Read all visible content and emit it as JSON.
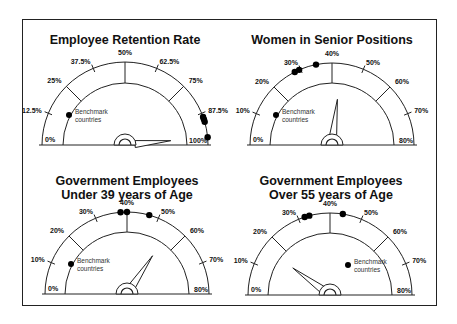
{
  "chart_data": [
    {
      "type": "gauge",
      "title": "Employee Retention Rate",
      "min": 0,
      "max": 100,
      "ticks": [
        "0%",
        "12.5%",
        "25%",
        "37.5%",
        "50%",
        "62.5%",
        "75%",
        "87.5%",
        "100%"
      ],
      "tick_values": [
        0,
        12.5,
        25,
        37.5,
        50,
        62.5,
        75,
        87.5,
        100
      ],
      "needle_value": 97,
      "benchmark_values": [
        89,
        90,
        91,
        97
      ],
      "legend": "Benchmark countries",
      "legend_position": "left"
    },
    {
      "type": "gauge",
      "title": "Women in Senior Positions",
      "min": 0,
      "max": 80,
      "ticks": [
        "0%",
        "10%",
        "20%",
        "30%",
        "40%",
        "50%",
        "60%",
        "70%",
        "80%"
      ],
      "tick_values": [
        0,
        10,
        20,
        30,
        40,
        50,
        60,
        70,
        80
      ],
      "needle_value": 43,
      "benchmark_values": [
        28,
        29.5,
        35
      ],
      "legend": "Benchmark countries",
      "legend_position": "left"
    },
    {
      "type": "gauge",
      "title": "Government Employees Under 39 years of Age",
      "min": 0,
      "max": 80,
      "ticks": [
        "0%",
        "10%",
        "20%",
        "30%",
        "40%",
        "50%",
        "60%",
        "70%",
        "80%"
      ],
      "tick_values": [
        0,
        10,
        20,
        30,
        40,
        50,
        60,
        70,
        80
      ],
      "needle_value": 55,
      "benchmark_values": [
        38,
        40,
        47
      ],
      "legend": "Benchmark countries",
      "legend_position": "left"
    },
    {
      "type": "gauge",
      "title": "Government Employees Over 55 years of Age",
      "min": 0,
      "max": 80,
      "ticks": [
        "0%",
        "10%",
        "20%",
        "30%",
        "40%",
        "50%",
        "60%",
        "70%",
        "80%"
      ],
      "tick_values": [
        0,
        10,
        20,
        30,
        40,
        50,
        60,
        70,
        80
      ],
      "needle_value": 16,
      "benchmark_values": [
        32,
        33.5,
        44
      ],
      "legend": "Benchmark countries",
      "legend_position": "right"
    }
  ],
  "panels": [
    {
      "title_line1": "Employee Retention Rate",
      "title_line2": ""
    },
    {
      "title_line1": "Women in Senior Positions",
      "title_line2": ""
    },
    {
      "title_line1": "Government Employees",
      "title_line2": "Under 39 years of Age"
    },
    {
      "title_line1": "Government Employees",
      "title_line2": "Over 55 years of Age"
    }
  ],
  "legend": {
    "line1": "Benchmark",
    "line2": "countries"
  }
}
